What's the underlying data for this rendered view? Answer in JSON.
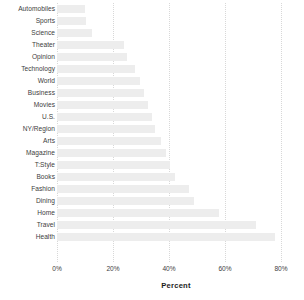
{
  "chart_data": {
    "type": "bar",
    "orientation": "horizontal",
    "title": "",
    "xlabel": "Percent",
    "ylabel": "",
    "xlim": [
      0,
      85
    ],
    "xticks": [
      0,
      20,
      40,
      60,
      80
    ],
    "xtick_labels": [
      "0%",
      "20%",
      "40%",
      "60%",
      "80%"
    ],
    "grid": true,
    "grid_axis": "x",
    "legend": false,
    "bar_color": "#ededed",
    "text_color": "#3d3d3d",
    "categories": [
      "Automobiles",
      "Sports",
      "Science",
      "Theater",
      "Opinion",
      "Technology",
      "World",
      "Business",
      "Movies",
      "U.S.",
      "NY/Region",
      "Arts",
      "Magazine",
      "T:Style",
      "Books",
      "Fashion",
      "Dining",
      "Home",
      "Travel",
      "Health"
    ],
    "values": [
      10.0,
      10.5,
      12.5,
      24.0,
      25.0,
      28.0,
      29.5,
      31.0,
      32.5,
      34.0,
      35.0,
      37.0,
      39.0,
      40.5,
      42.0,
      47.0,
      49.0,
      58.0,
      71.0,
      78.0
    ]
  }
}
